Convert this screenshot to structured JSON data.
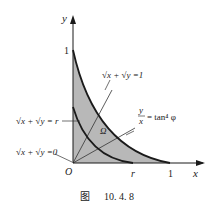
{
  "figure": {
    "caption_prefix": "图",
    "caption_number": "10. 4. 8"
  },
  "axes": {
    "x_label": "x",
    "y_label": "y",
    "origin_label": "O",
    "x_tick_one": "1",
    "x_tick_r": "r",
    "y_tick_one": "1"
  },
  "curves": {
    "outer_label": "√x + √y =1",
    "inner_label": "√x + √y = r",
    "zero_label": "√x + √y =0",
    "ray_label_frac_num": "y",
    "ray_label_frac_den": "x",
    "ray_label_rhs": "= tan⁴ φ"
  },
  "region": {
    "label": "Ω",
    "fill_color": "#b8b8b8"
  },
  "colors": {
    "stroke": "#1a1a1a",
    "fill": "#b8b8b8"
  }
}
